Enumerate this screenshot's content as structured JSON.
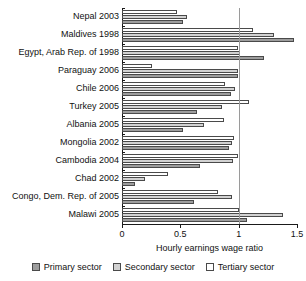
{
  "chart_data": {
    "type": "bar",
    "orientation": "horizontal",
    "title": "",
    "xlabel": "Hourly earnings wage ratio",
    "ylabel": "",
    "xlim": [
      0,
      1.5
    ],
    "xticks": [
      0,
      0.5,
      1,
      1.5
    ],
    "xtick_labels": [
      "0",
      "0.5",
      "1",
      "1.5"
    ],
    "grid": "vertical gridline at 1.0",
    "legend_position": "bottom-center",
    "categories": [
      "Nepal 2003",
      "Maldives 1998",
      "Egypt, Arab Rep. of 1998",
      "Paraguay 2006",
      "Chile 2006",
      "Turkey 2005",
      "Albania 2005",
      "Mongolia 2002",
      "Cambodia 2004",
      "Chad 2002",
      "Congo, Dem. Rep. of 2005",
      "Malawi 2005"
    ],
    "series": [
      {
        "name": "Primary sector",
        "color": "#9d9d9d",
        "values": [
          0.52,
          1.47,
          1.22,
          0.99,
          0.93,
          0.64,
          0.52,
          0.92,
          0.67,
          0.11,
          0.62,
          1.07
        ]
      },
      {
        "name": "Secondary sector",
        "color": "#d2d2d2",
        "values": [
          0.56,
          1.3,
          1.01,
          0.99,
          0.97,
          0.86,
          0.7,
          0.94,
          0.95,
          0.2,
          0.94,
          1.38
        ]
      },
      {
        "name": "Tertiary sector",
        "color": "#ffffff",
        "values": [
          0.47,
          1.12,
          0.99,
          0.26,
          0.88,
          1.09,
          0.87,
          0.96,
          0.99,
          0.39,
          0.82,
          1.0
        ]
      }
    ]
  },
  "legend": {
    "items": [
      {
        "label": "Primary sector",
        "key": "primary"
      },
      {
        "label": "Secondary sector",
        "key": "secondary"
      },
      {
        "label": "Tertiary sector",
        "key": "tertiary"
      }
    ]
  }
}
